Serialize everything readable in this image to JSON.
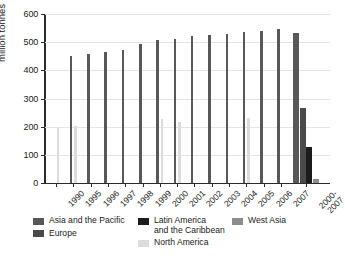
{
  "chart_data": {
    "type": "bar",
    "title": "",
    "subtitle": "",
    "xlabel": "",
    "ylabel": "million tonnes",
    "ylim": [
      0,
      600
    ],
    "yticks": [
      0,
      100,
      200,
      300,
      400,
      500,
      600
    ],
    "grid": true,
    "legend_position": "bottom",
    "categories": [
      "1990",
      "1995",
      "1996",
      "1997",
      "1998",
      "1999",
      "2000",
      "2001",
      "2002",
      "2003",
      "2004",
      "2005",
      "2006",
      "2007",
      "2000-\n2007"
    ],
    "series": [
      {
        "name": "Asia and the Pacific",
        "color": "#585858",
        "values": [
          null,
          450,
          459,
          467,
          473,
          495,
          508,
          511,
          523,
          526,
          529,
          536,
          541,
          548,
          531
        ]
      },
      {
        "name": "Europe",
        "color": "#4a4a4a",
        "values": [
          null,
          null,
          null,
          null,
          null,
          null,
          null,
          null,
          null,
          null,
          null,
          null,
          null,
          null,
          268
        ]
      },
      {
        "name": "Latin America and the Caribbean",
        "color": "#1c1c1c",
        "values": [
          null,
          null,
          null,
          null,
          null,
          null,
          null,
          null,
          null,
          null,
          null,
          null,
          null,
          null,
          127
        ]
      },
      {
        "name": "North America",
        "color": "#dcdcdc",
        "values": [
          195,
          202,
          null,
          null,
          null,
          null,
          227,
          218,
          null,
          null,
          null,
          232,
          null,
          null,
          null
        ]
      },
      {
        "name": "West Asia",
        "color": "#8c8c8c",
        "values": [
          null,
          null,
          null,
          null,
          null,
          null,
          null,
          null,
          null,
          null,
          null,
          null,
          null,
          null,
          15
        ]
      }
    ]
  },
  "legend": {
    "columns": [
      {
        "items": [
          {
            "label": "Asia and the Pacific",
            "color": "#585858"
          },
          {
            "label": "Europe",
            "color": "#4a4a4a"
          }
        ]
      },
      {
        "items": [
          {
            "label": "Latin America\nand the Caribbean",
            "color": "#1c1c1c"
          },
          {
            "label": "North America",
            "color": "#dcdcdc"
          }
        ]
      },
      {
        "items": [
          {
            "label": "West Asia",
            "color": "#8c8c8c"
          }
        ]
      }
    ]
  }
}
